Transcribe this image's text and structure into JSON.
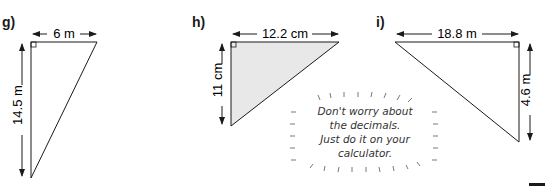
{
  "problems": [
    {
      "label": "g)",
      "base": "6 m",
      "height": "14.5 m",
      "shaded": false
    },
    {
      "label": "h)",
      "base": "12.2 cm",
      "height": "11 cm",
      "shaded": true
    },
    {
      "label": "i)",
      "base": "18.8 m",
      "height": "4.6 m",
      "shaded": false
    }
  ],
  "tip": {
    "lines": [
      "Don't worry about",
      "the decimals.",
      "Just do it on your",
      "calculator."
    ]
  },
  "colors": {
    "line": "#1a1a1a",
    "shade": "#e8e8e8"
  }
}
